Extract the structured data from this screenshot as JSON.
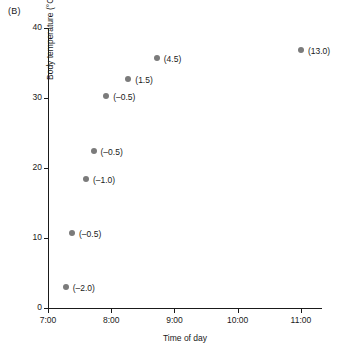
{
  "panel": {
    "label": "(B)"
  },
  "chart_data": {
    "type": "scatter",
    "title": "",
    "xlabel": "Time of day",
    "ylabel": "Body temperature (°C)",
    "xlim": [
      7.0,
      11.333333
    ],
    "ylim": [
      0,
      40
    ],
    "grid": false,
    "legend": null,
    "xticks": [
      {
        "value": 7.0,
        "label": "7:00"
      },
      {
        "value": 8.0,
        "label": "8:00"
      },
      {
        "value": 9.0,
        "label": "9:00"
      },
      {
        "value": 10.0,
        "label": "10:00"
      },
      {
        "value": 11.0,
        "label": "11:00"
      }
    ],
    "yticks": [
      {
        "value": 0,
        "label": "0"
      },
      {
        "value": 10,
        "label": "10"
      },
      {
        "value": 20,
        "label": "20"
      },
      {
        "value": 30,
        "label": "30"
      },
      {
        "value": 40,
        "label": "40"
      }
    ],
    "point_color": "#7b7b7b",
    "points": [
      {
        "x": 7.28,
        "y": 3.0,
        "label": "(–2.0)"
      },
      {
        "x": 7.38,
        "y": 10.7,
        "label": "(–0.5)"
      },
      {
        "x": 7.6,
        "y": 18.5,
        "label": "(–1.0)"
      },
      {
        "x": 7.72,
        "y": 22.5,
        "label": "(–0.5)"
      },
      {
        "x": 7.92,
        "y": 30.3,
        "label": "(–0.5)"
      },
      {
        "x": 8.27,
        "y": 32.7,
        "label": "(1.5)"
      },
      {
        "x": 8.72,
        "y": 35.7,
        "label": "(4.5)"
      },
      {
        "x": 11.0,
        "y": 36.8,
        "label": "(13.0)"
      }
    ]
  }
}
